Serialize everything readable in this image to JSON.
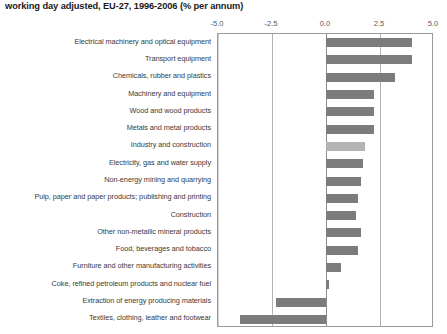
{
  "chart_data": {
    "type": "bar",
    "orientation": "horizontal",
    "title": "working day adjusted, EU-27, 1996-2006 (% per annum)",
    "xlabel": "",
    "ylabel": "",
    "xlim": [
      -5.0,
      5.0
    ],
    "xticks": [
      "-5.0",
      "-2.5",
      "0.0",
      "2.5",
      "5.0"
    ],
    "xtick_values": [
      -5.0,
      -2.5,
      0.0,
      2.5,
      5.0
    ],
    "grid": true,
    "legend": "none",
    "colors": {
      "bar": "#7c7c7c",
      "bar_highlight": "#b4b4b4",
      "gridline": "#b3b3b3",
      "frame": "#9a9a9a",
      "text": "#3a3a3a"
    },
    "categories": [
      "Electrical machinery and optical equipment",
      "Transport equipment",
      "Chemicals, rubber and plastics",
      "Machinery and equipment",
      "Wood and wood products",
      "Metals and metal products",
      "Industry and construction",
      "Electricity, gas and water supply",
      "Non-energy mining and quarrying",
      "Pulp, paper and paper products; publishing and printing",
      "Construction",
      "Other non-metallic mineral products",
      "Food, beverages and tobacco",
      "Furniture and other manufacturing activities",
      "Coke, refined petroleum products and nuclear fuel",
      "Extraction of energy producing materials",
      "Textiles, clothing, leather and footwear"
    ],
    "values": [
      4.0,
      4.0,
      3.2,
      2.2,
      2.2,
      2.2,
      1.8,
      1.7,
      1.6,
      1.5,
      1.4,
      1.6,
      1.5,
      0.7,
      0.15,
      -2.3,
      -4.0
    ],
    "highlight_index": 6
  }
}
